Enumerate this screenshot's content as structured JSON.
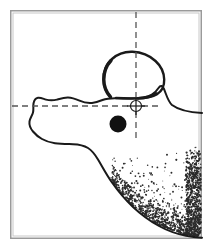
{
  "figure": {
    "title": "Lateral anatomical outline tracing with reference axes",
    "kind": "line-drawing",
    "background_color": "#ffffff",
    "ink_color": "#1a1a1a",
    "frame": {
      "present": true,
      "color": "#9a9a9a",
      "inner_color": "#c8c8c8",
      "x": 10,
      "y": 10,
      "width": 192,
      "height": 229,
      "stroke_width": 1.5
    },
    "axes": {
      "color": "#555555",
      "dash_pattern": "6 4",
      "stroke_width": 1.3,
      "horizontal": {
        "label": "horizontal-reference-axis",
        "y": 106,
        "x_start": 12,
        "x_end": 161
      },
      "vertical": {
        "label": "vertical-reference-axis",
        "x": 136,
        "y_start": 12,
        "y_end": 138
      }
    },
    "markers": [
      {
        "name": "crosshair-registration-marker",
        "type": "crosshair-circle",
        "cx": 136,
        "cy": 106,
        "radius": 5.5,
        "arm_length": 9,
        "color": "#1a1a1a",
        "stroke_width": 1.2
      },
      {
        "name": "filled-dot-marker",
        "type": "filled-circle",
        "cx": 118,
        "cy": 124,
        "radius": 8.5,
        "color": "#111111"
      }
    ],
    "contours": [
      {
        "name": "main-outline-contour",
        "color": "#1a1a1a",
        "stroke_width": 2.0
      },
      {
        "name": "upper-blob-contour",
        "color": "#1a1a1a",
        "stroke_width": 2.4
      }
    ],
    "stipple": {
      "name": "stipple-shading-region",
      "color": "#2b2b2b",
      "description": "dotted shading, lower-right quadrant, density increasing toward the contour edge and along the right margin",
      "point_count": 1500,
      "seed": 20240517,
      "region": {
        "x": 108,
        "y": 146,
        "width": 94,
        "height": 92
      }
    }
  }
}
